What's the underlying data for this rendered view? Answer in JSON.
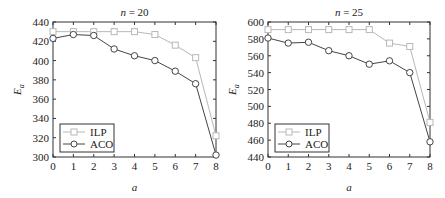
{
  "chart_data": [
    {
      "type": "line",
      "title": "n = 20",
      "xlabel": "a",
      "ylabel": "E_a",
      "x": [
        0,
        1,
        2,
        3,
        4,
        5,
        6,
        7,
        8
      ],
      "xlim": [
        0,
        8
      ],
      "ylim": [
        300,
        440
      ],
      "yticks": [
        300,
        320,
        340,
        360,
        380,
        400,
        420,
        440
      ],
      "xticks": [
        0,
        1,
        2,
        3,
        4,
        5,
        6,
        7,
        8
      ],
      "grid": false,
      "legend_position": "lower left",
      "series": [
        {
          "name": "ILP",
          "marker": "square",
          "color": "#b8b8b8",
          "values": [
            430,
            430,
            430,
            430,
            430,
            427,
            416,
            403,
            322
          ]
        },
        {
          "name": "ACO",
          "marker": "circle",
          "color": "#444444",
          "values": [
            423,
            427,
            426,
            412,
            405,
            400,
            389,
            376,
            302
          ]
        }
      ]
    },
    {
      "type": "line",
      "title": "n = 25",
      "xlabel": "a",
      "ylabel": "E_a",
      "x": [
        0,
        1,
        2,
        3,
        4,
        5,
        6,
        7,
        8
      ],
      "xlim": [
        0,
        8
      ],
      "ylim": [
        440,
        600
      ],
      "yticks": [
        440,
        460,
        480,
        500,
        520,
        540,
        560,
        580,
        600
      ],
      "xticks": [
        0,
        1,
        2,
        3,
        4,
        5,
        6,
        7,
        8
      ],
      "grid": false,
      "legend_position": "lower left",
      "series": [
        {
          "name": "ILP",
          "marker": "square",
          "color": "#b8b8b8",
          "values": [
            591,
            591,
            591,
            591,
            591,
            591,
            575,
            571,
            481
          ]
        },
        {
          "name": "ACO",
          "marker": "circle",
          "color": "#444444",
          "values": [
            581,
            575,
            576,
            566,
            560,
            550,
            554,
            540,
            458
          ]
        }
      ]
    }
  ]
}
